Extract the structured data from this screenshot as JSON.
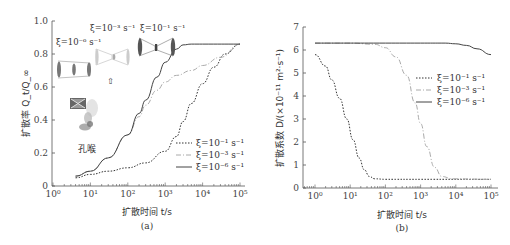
{
  "chart_data": [
    {
      "id": "a",
      "type": "line",
      "caption": "(a)",
      "title": "",
      "xlabel": "扩散时间 t/s",
      "ylabel": "扩散率 Q_t/Q_∞",
      "xscale": "log",
      "xlim": [
        1,
        100000
      ],
      "ylim": [
        0,
        1.0
      ],
      "xticks": [
        "10^0",
        "10^1",
        "10^2",
        "10^3",
        "10^4",
        "10^5"
      ],
      "yticks": [
        "0",
        "0.2",
        "0.4",
        "0.6",
        "0.8",
        "1.0"
      ],
      "grid": false,
      "legend_position": "lower right",
      "series": [
        {
          "name": "ξ=10^-1 s^-1",
          "style": "dotted",
          "x": [
            4,
            10,
            30,
            100,
            300,
            1000,
            2000,
            3000,
            5000,
            10000,
            20000,
            40000,
            100000
          ],
          "y": [
            0.05,
            0.07,
            0.09,
            0.11,
            0.14,
            0.21,
            0.3,
            0.39,
            0.5,
            0.62,
            0.72,
            0.8,
            0.86
          ]
        },
        {
          "name": "ξ=10^-3 s^-1",
          "style": "dashdot",
          "x": [
            4,
            10,
            30,
            100,
            200,
            300,
            600,
            1000,
            2000,
            5000,
            10000,
            30000,
            100000
          ],
          "y": [
            0.06,
            0.09,
            0.17,
            0.31,
            0.42,
            0.49,
            0.58,
            0.63,
            0.67,
            0.7,
            0.73,
            0.78,
            0.86
          ]
        },
        {
          "name": "ξ=10^-6 s^-1",
          "style": "solid",
          "x": [
            4,
            10,
            30,
            100,
            200,
            300,
            600,
            1000,
            2000,
            3000,
            5000,
            10000,
            100000
          ],
          "y": [
            0.06,
            0.09,
            0.17,
            0.31,
            0.44,
            0.52,
            0.66,
            0.75,
            0.83,
            0.855,
            0.86,
            0.86,
            0.86
          ]
        }
      ],
      "annotations": [
        "ξ=10^-6 s^-1",
        "ξ=10^-3 s^-1",
        "ξ=10^-1 s^-1",
        "⇧",
        "孔喉"
      ]
    },
    {
      "id": "b",
      "type": "line",
      "caption": "(b)",
      "title": "",
      "xlabel": "扩散时间 t/s",
      "ylabel": "扩散系数 D/(×10^-11 m^2·s^-1)",
      "xscale": "log",
      "xlim": [
        0.5,
        150000
      ],
      "ylim": [
        0,
        7
      ],
      "xticks": [
        "10^0",
        "10^1",
        "10^2",
        "10^3",
        "10^4",
        "10^5"
      ],
      "yticks": [
        "0",
        "1",
        "2",
        "3",
        "4",
        "5",
        "6",
        "7"
      ],
      "grid": false,
      "legend_position": "upper right",
      "series": [
        {
          "name": "ξ=10^-1 s^-1",
          "style": "dotted",
          "x": [
            1,
            2,
            3,
            5,
            8,
            12,
            18,
            25,
            35,
            50,
            100,
            1000,
            100000
          ],
          "y": [
            5.8,
            5.3,
            4.7,
            3.9,
            3.0,
            2.1,
            1.3,
            0.8,
            0.5,
            0.4,
            0.38,
            0.38,
            0.38
          ]
        },
        {
          "name": "ξ=10^-3 s^-1",
          "style": "dashdot",
          "x": [
            1,
            10,
            50,
            100,
            200,
            400,
            700,
            1000,
            1500,
            2500,
            4000,
            8000,
            100000
          ],
          "y": [
            6.3,
            6.3,
            6.25,
            6.1,
            5.7,
            4.9,
            3.7,
            2.8,
            1.8,
            0.9,
            0.5,
            0.4,
            0.38
          ]
        },
        {
          "name": "ξ=10^-6 s^-1",
          "style": "solid",
          "x": [
            1,
            100,
            1000,
            5000,
            10000,
            20000,
            40000,
            100000
          ],
          "y": [
            6.3,
            6.3,
            6.3,
            6.3,
            6.27,
            6.2,
            6.05,
            5.8
          ]
        }
      ]
    }
  ],
  "figure": {
    "caption_a": "(a)",
    "caption_b": "(b)",
    "xlabel_a": "扩散时间 t/s",
    "xlabel_b": "扩散时间 t/s",
    "ylabel_a": "扩散率 Q_t/Q_∞",
    "ylabel_b": "扩散系数 D/(×10⁻¹¹ m²·s⁻¹)",
    "legend": [
      "ξ=10⁻¹ s⁻¹",
      "ξ=10⁻³ s⁻¹",
      "ξ=10⁻⁶ s⁻¹"
    ],
    "annotations": {
      "xi6": "ξ=10⁻⁶ s⁻¹",
      "xi3": "ξ=10⁻³ s⁻¹",
      "xi1": "ξ=10⁻¹ s⁻¹",
      "arrow": "⇧",
      "pore_throat": "孔喉"
    }
  }
}
